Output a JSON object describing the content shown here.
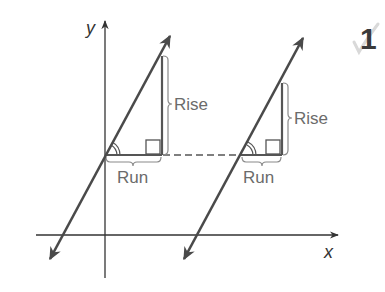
{
  "figure": {
    "type": "slope rise-over-run diagram of two parallel lines",
    "axes": {
      "x_label": "x",
      "y_label": "y"
    },
    "lines": [
      {
        "name": "line-1",
        "triangle": {
          "rise_label": "Rise",
          "run_label": "Run"
        }
      },
      {
        "name": "line-2",
        "triangle": {
          "rise_label": "Rise",
          "run_label": "Run"
        }
      }
    ],
    "connector": "dashed horizontal segment joining the two triangles",
    "corner_mark": "1",
    "colors": {
      "line": "#4a4a4a",
      "axis": "#333333",
      "label": "#6b6b6b",
      "triangle": "#555555",
      "check": "#d9d9d9"
    }
  }
}
